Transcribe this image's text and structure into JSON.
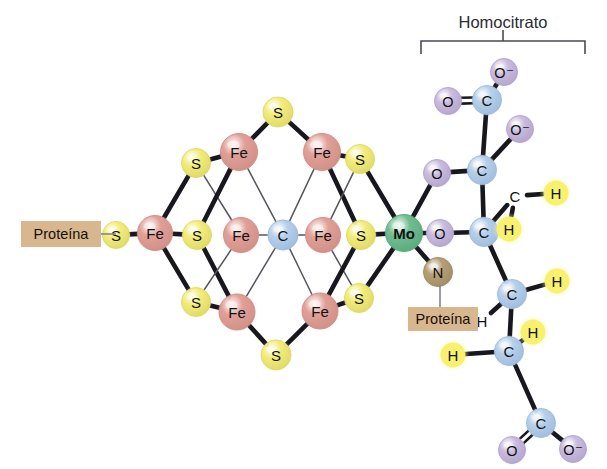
{
  "figure": {
    "title": "",
    "background_color": "#ffffff"
  },
  "bracket": {
    "label": "Homocitrato",
    "label_x": 503,
    "label_y": 22,
    "left_x": 421,
    "right_x": 585,
    "bar_y": 41,
    "tick_drop": 13,
    "stem_top": 30,
    "stem_bottom": 41,
    "color": "#4a4a57",
    "stroke_width": 1.6
  },
  "palette": {
    "sulfur_fill": "#f2ec7a",
    "sulfur_rim": "#ded86a",
    "sulfur_glow": "#f7f3a8",
    "iron_fill": "#e0a098",
    "iron_rim": "#cf8f87",
    "iron_glow": "#ecc0ba",
    "carbon_fill": "#b7cfe9",
    "carbon_rim": "#9dbcdd",
    "carbon_glow": "#cfe0f2",
    "oxygen_fill": "#c9bcdd",
    "oxygen_rim": "#b3a4cc",
    "oxygen_glow": "#ddd3ea",
    "molybdenum_fill": "#72bd92",
    "molybdenum_rim": "#57a97c",
    "molybdenum_glow": "#9ad3b1",
    "nitrogen_fill": "#b5a077",
    "nitrogen_rim": "#a08c63",
    "nitrogen_glow": "#cbbb97",
    "hydrogen_fill": "#f7f06a",
    "hydrogen_rim": "#f7f06a",
    "hydrogen_glow": "#faf7a6",
    "bond_dark": "#17171d",
    "bond_thin": "#55555f",
    "bond_gray": "#8b8b93",
    "protein_box_fill": "#d8b78e",
    "protein_box_text": "#151008",
    "text_dark": "#111111"
  },
  "protein_labels": [
    {
      "id": "protein-left",
      "text": "Proteína",
      "x": 21,
      "y": 221,
      "w": 80,
      "h": 26,
      "text_x": 61,
      "text_y": 234,
      "connector": {
        "x1": 101,
        "y1": 234,
        "x2": 116,
        "y2": 234,
        "color": "#8b8b93",
        "width": 1.7
      }
    },
    {
      "id": "protein-right",
      "text": "Proteína",
      "x": 408,
      "y": 307,
      "w": 70,
      "h": 24,
      "text_x": 443,
      "text_y": 319,
      "connector": {
        "x1": 440,
        "y1": 307,
        "x2": 440,
        "y2": 285,
        "color": "#8b8b93",
        "width": 1.7
      }
    }
  ],
  "atoms": [
    {
      "id": "s-left-terminal",
      "label": "S",
      "element": "S",
      "x": 116,
      "y": 235,
      "r": 13.5,
      "font": 15
    },
    {
      "id": "fe-left",
      "label": "Fe",
      "element": "Fe",
      "x": 155,
      "y": 233,
      "r": 17.5,
      "font": 15
    },
    {
      "id": "s-upper-left",
      "label": "S",
      "element": "S",
      "x": 196,
      "y": 163,
      "r": 14.5,
      "font": 15
    },
    {
      "id": "s-mid-left",
      "label": "S",
      "element": "S",
      "x": 197,
      "y": 235,
      "r": 14.5,
      "font": 15
    },
    {
      "id": "s-lower-left",
      "label": "S",
      "element": "S",
      "x": 196,
      "y": 302,
      "r": 14.5,
      "font": 15
    },
    {
      "id": "fe-top-left",
      "label": "Fe",
      "element": "Fe",
      "x": 239,
      "y": 152,
      "r": 18.5,
      "font": 15
    },
    {
      "id": "fe-mid-left",
      "label": "Fe",
      "element": "Fe",
      "x": 241,
      "y": 235,
      "r": 17.5,
      "font": 15
    },
    {
      "id": "fe-bottom-left",
      "label": "Fe",
      "element": "Fe",
      "x": 237,
      "y": 312,
      "r": 18,
      "font": 15
    },
    {
      "id": "s-apex-top",
      "label": "S",
      "element": "S",
      "x": 278,
      "y": 112,
      "r": 15,
      "font": 15
    },
    {
      "id": "s-apex-bottom",
      "label": "S",
      "element": "S",
      "x": 276,
      "y": 355,
      "r": 15,
      "font": 15
    },
    {
      "id": "c-center",
      "label": "C",
      "element": "C",
      "x": 283,
      "y": 235,
      "r": 15,
      "font": 15
    },
    {
      "id": "fe-top-right",
      "label": "Fe",
      "element": "Fe",
      "x": 322,
      "y": 152,
      "r": 18.5,
      "font": 15
    },
    {
      "id": "fe-mid-right",
      "label": "Fe",
      "element": "Fe",
      "x": 323,
      "y": 235,
      "r": 17.5,
      "font": 15
    },
    {
      "id": "fe-bottom-right",
      "label": "Fe",
      "element": "Fe",
      "x": 320,
      "y": 311,
      "r": 18,
      "font": 15
    },
    {
      "id": "s-upper-right",
      "label": "S",
      "element": "S",
      "x": 360,
      "y": 159,
      "r": 14.5,
      "font": 15
    },
    {
      "id": "s-mid-right",
      "label": "S",
      "element": "S",
      "x": 361,
      "y": 235,
      "r": 14.5,
      "font": 15
    },
    {
      "id": "s-lower-right",
      "label": "S",
      "element": "S",
      "x": 359,
      "y": 298,
      "r": 14.5,
      "font": 15
    },
    {
      "id": "mo-center",
      "label": "Mo",
      "element": "Mo",
      "x": 404,
      "y": 233,
      "r": 18.5,
      "font": 15,
      "bold": true
    },
    {
      "id": "n-protein",
      "label": "N",
      "element": "N",
      "x": 438,
      "y": 272,
      "r": 14.5,
      "font": 15
    },
    {
      "id": "o-mo-upper",
      "label": "O",
      "element": "O",
      "x": 437,
      "y": 173,
      "r": 13.5,
      "font": 14.5
    },
    {
      "id": "o-mo-lower",
      "label": "O",
      "element": "O",
      "x": 440,
      "y": 233,
      "r": 13.5,
      "font": 14.5
    },
    {
      "id": "c-alpha",
      "label": "C",
      "element": "C",
      "x": 482,
      "y": 170,
      "r": 14.5,
      "font": 15
    },
    {
      "id": "c-beta",
      "label": "C",
      "element": "C",
      "x": 484,
      "y": 232,
      "r": 14.5,
      "font": 15
    },
    {
      "id": "o-carboxy-top-left",
      "label": "O",
      "element": "O",
      "x": 448,
      "y": 101,
      "r": 13.5,
      "font": 14.5
    },
    {
      "id": "c-carboxy-top",
      "label": "C",
      "element": "C",
      "x": 487,
      "y": 100,
      "r": 14.5,
      "font": 15
    },
    {
      "id": "o-carboxy-top-right",
      "label": "O⁻",
      "element": "O",
      "x": 504,
      "y": 72,
      "r": 13.5,
      "font": 14.5,
      "charge": true
    },
    {
      "id": "o-hydroxyl",
      "label": "O⁻",
      "element": "O",
      "x": 520,
      "y": 129,
      "r": 13.5,
      "font": 14.5,
      "charge": true
    },
    {
      "id": "c-ch-upper",
      "label": "C",
      "element": "C",
      "x": 515,
      "y": 196,
      "r": 13,
      "font": 15,
      "plain": true
    },
    {
      "id": "h-upper-right",
      "label": "H",
      "element": "H",
      "x": 556,
      "y": 193,
      "r": 14,
      "font": 15
    },
    {
      "id": "h-upper-lower",
      "label": "H",
      "element": "H",
      "x": 509,
      "y": 229,
      "r": 14,
      "font": 15
    },
    {
      "id": "c-chain-upper",
      "label": "C",
      "element": "C",
      "x": 512,
      "y": 294,
      "r": 14.5,
      "font": 15
    },
    {
      "id": "h-chain-right",
      "label": "H",
      "element": "H",
      "x": 557,
      "y": 281,
      "r": 14,
      "font": 15
    },
    {
      "id": "h-chain-left",
      "label": "H",
      "element": "H",
      "x": 482,
      "y": 321,
      "r": 13,
      "font": 15,
      "plain": true
    },
    {
      "id": "c-chain-lower",
      "label": "C",
      "element": "C",
      "x": 509,
      "y": 351,
      "r": 14.5,
      "font": 15
    },
    {
      "id": "h-lower-right",
      "label": "H",
      "element": "H",
      "x": 533,
      "y": 332,
      "r": 14,
      "font": 15
    },
    {
      "id": "h-lower-left",
      "label": "H",
      "element": "H",
      "x": 453,
      "y": 355,
      "r": 14,
      "font": 15
    },
    {
      "id": "c-carboxy-bottom",
      "label": "C",
      "element": "C",
      "x": 541,
      "y": 423,
      "r": 14.5,
      "font": 15
    },
    {
      "id": "o-carboxy-bottom-left",
      "label": "O",
      "element": "O",
      "x": 512,
      "y": 450,
      "r": 13.5,
      "font": 14.5
    },
    {
      "id": "o-carboxy-bottom-right",
      "label": "O⁻",
      "element": "O",
      "x": 573,
      "y": 449,
      "r": 13.5,
      "font": 14.5,
      "charge": true
    }
  ],
  "bonds": [
    {
      "from": "s-left-terminal",
      "to": "fe-left",
      "style": "thick"
    },
    {
      "from": "fe-left",
      "to": "s-upper-left",
      "style": "thick"
    },
    {
      "from": "fe-left",
      "to": "s-mid-left",
      "style": "thick"
    },
    {
      "from": "fe-left",
      "to": "s-lower-left",
      "style": "thick"
    },
    {
      "from": "s-upper-left",
      "to": "fe-top-left",
      "style": "thick"
    },
    {
      "from": "s-upper-left",
      "to": "fe-mid-left",
      "style": "thin"
    },
    {
      "from": "s-mid-left",
      "to": "fe-top-left",
      "style": "thick"
    },
    {
      "from": "s-mid-left",
      "to": "fe-bottom-left",
      "style": "thick"
    },
    {
      "from": "s-lower-left",
      "to": "fe-mid-left",
      "style": "thin"
    },
    {
      "from": "s-lower-left",
      "to": "fe-bottom-left",
      "style": "thick"
    },
    {
      "from": "fe-top-left",
      "to": "s-apex-top",
      "style": "thick"
    },
    {
      "from": "fe-top-left",
      "to": "c-center",
      "style": "thin"
    },
    {
      "from": "fe-mid-left",
      "to": "c-center",
      "style": "thin"
    },
    {
      "from": "fe-bottom-left",
      "to": "s-apex-bottom",
      "style": "thick"
    },
    {
      "from": "fe-bottom-left",
      "to": "c-center",
      "style": "thin"
    },
    {
      "from": "s-apex-top",
      "to": "fe-top-right",
      "style": "thick"
    },
    {
      "from": "s-apex-bottom",
      "to": "fe-bottom-right",
      "style": "thick"
    },
    {
      "from": "c-center",
      "to": "fe-top-right",
      "style": "thin"
    },
    {
      "from": "c-center",
      "to": "fe-mid-right",
      "style": "thin"
    },
    {
      "from": "c-center",
      "to": "fe-bottom-right",
      "style": "thin"
    },
    {
      "from": "fe-top-right",
      "to": "s-upper-right",
      "style": "thick"
    },
    {
      "from": "fe-top-right",
      "to": "s-mid-right",
      "style": "thick"
    },
    {
      "from": "fe-mid-right",
      "to": "s-upper-right",
      "style": "thin"
    },
    {
      "from": "fe-mid-right",
      "to": "s-lower-right",
      "style": "thin"
    },
    {
      "from": "fe-bottom-right",
      "to": "s-mid-right",
      "style": "thick"
    },
    {
      "from": "fe-bottom-right",
      "to": "s-lower-right",
      "style": "thick"
    },
    {
      "from": "s-upper-right",
      "to": "mo-center",
      "style": "thick"
    },
    {
      "from": "s-mid-right",
      "to": "mo-center",
      "style": "thick"
    },
    {
      "from": "s-lower-right",
      "to": "mo-center",
      "style": "thick"
    },
    {
      "from": "mo-center",
      "to": "n-protein",
      "style": "thick"
    },
    {
      "from": "mo-center",
      "to": "o-mo-upper",
      "style": "thick"
    },
    {
      "from": "mo-center",
      "to": "o-mo-lower",
      "style": "thick"
    },
    {
      "from": "o-mo-upper",
      "to": "c-alpha",
      "style": "thick"
    },
    {
      "from": "o-mo-lower",
      "to": "c-beta",
      "style": "thick"
    },
    {
      "from": "c-alpha",
      "to": "c-beta",
      "style": "thick"
    },
    {
      "from": "c-alpha",
      "to": "c-carboxy-top",
      "style": "thick"
    },
    {
      "from": "c-alpha",
      "to": "o-hydroxyl",
      "style": "thick"
    },
    {
      "from": "c-carboxy-top",
      "to": "o-carboxy-top-left",
      "style": "double"
    },
    {
      "from": "c-carboxy-top",
      "to": "o-carboxy-top-right",
      "style": "thick"
    },
    {
      "from": "c-beta",
      "to": "c-ch-upper",
      "style": "thick"
    },
    {
      "from": "c-ch-upper",
      "to": "h-upper-right",
      "style": "thick"
    },
    {
      "from": "c-ch-upper",
      "to": "h-upper-lower",
      "style": "thick"
    },
    {
      "from": "c-beta",
      "to": "c-chain-upper",
      "style": "thick"
    },
    {
      "from": "c-chain-upper",
      "to": "h-chain-right",
      "style": "thick"
    },
    {
      "from": "c-chain-upper",
      "to": "h-chain-left",
      "style": "thick"
    },
    {
      "from": "c-chain-upper",
      "to": "c-chain-lower",
      "style": "thick"
    },
    {
      "from": "c-chain-lower",
      "to": "h-lower-right",
      "style": "thick"
    },
    {
      "from": "c-chain-lower",
      "to": "h-lower-left",
      "style": "thick"
    },
    {
      "from": "c-chain-lower",
      "to": "c-carboxy-bottom",
      "style": "thick"
    },
    {
      "from": "c-carboxy-bottom",
      "to": "o-carboxy-bottom-left",
      "style": "double"
    },
    {
      "from": "c-carboxy-bottom",
      "to": "o-carboxy-bottom-right",
      "style": "thick"
    }
  ]
}
